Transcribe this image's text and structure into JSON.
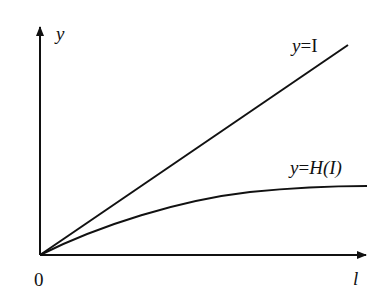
{
  "diagram": {
    "axes": {
      "x_label": "l",
      "y_label": "y",
      "origin_label": "0"
    },
    "curves": [
      {
        "name": "identity-line",
        "label_prefix": "y",
        "label_eq": "=",
        "label_body": "I",
        "style": "straight"
      },
      {
        "name": "h-curve",
        "label_prefix": "y",
        "label_eq": "=",
        "label_body": "H(I)",
        "style": "saturating"
      }
    ],
    "colors": {
      "line": "#111111",
      "background": "#ffffff"
    }
  }
}
